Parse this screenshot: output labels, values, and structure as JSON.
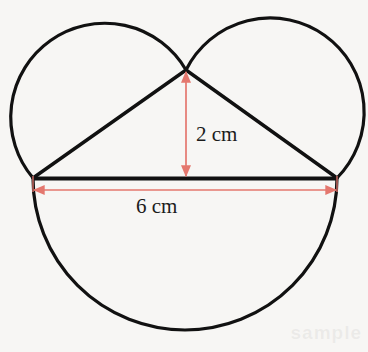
{
  "diagram": {
    "type": "geometry-figure",
    "background_color": "#f7f6f4",
    "stroke_color": "#111111",
    "dimension_color": "#e4776e",
    "labels": {
      "height": "2 cm",
      "base": "6 cm"
    },
    "watermark": "sample",
    "measurements": [
      {
        "name": "triangle-base",
        "value": 6,
        "unit": "cm",
        "label": "6 cm",
        "orientation": "horizontal"
      },
      {
        "name": "triangle-height",
        "value": 2,
        "unit": "cm",
        "label": "2 cm",
        "orientation": "vertical"
      }
    ],
    "points": {
      "left_vertex": {
        "x": 33,
        "y": 178
      },
      "right_vertex": {
        "x": 337,
        "y": 178
      },
      "apex": {
        "x": 186,
        "y": 70
      }
    },
    "arcs": {
      "large_lower_semicircle": {
        "center_x": 185,
        "center_y": 178,
        "radius": 152
      },
      "left_upper_circle": {
        "center_x": 109.5,
        "center_y": 124,
        "radius": 94
      },
      "right_upper_circle": {
        "center_x": 261.5,
        "center_y": 124,
        "radius": 94
      }
    },
    "segments": [
      {
        "name": "triangle-base-line",
        "from": "left_vertex",
        "to": "right_vertex"
      },
      {
        "name": "triangle-left-side",
        "from": "left_vertex",
        "to": "apex"
      },
      {
        "name": "triangle-right-side",
        "from": "apex",
        "to": "right_vertex"
      }
    ]
  }
}
